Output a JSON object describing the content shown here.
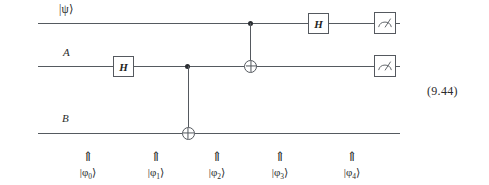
{
  "figure": {
    "type": "quantum-circuit-diagram",
    "equation_number": "(9.44)",
    "ink_color": "#55595f",
    "text_color": "#2b2b2b"
  },
  "wires": [
    {
      "id": "psi",
      "label": "|ψ⟩",
      "name": "psi-wire"
    },
    {
      "id": "a",
      "label": "A",
      "name": "a-wire"
    },
    {
      "id": "b",
      "label": "B",
      "name": "b-wire"
    }
  ],
  "gates": [
    {
      "id": "h-a",
      "label": "H",
      "kind": "hadamard",
      "wire": "a",
      "column": 1
    },
    {
      "id": "cnot-ab",
      "label": "",
      "kind": "cnot",
      "control": "a",
      "target": "b",
      "column": 2
    },
    {
      "id": "cnot-psia",
      "label": "",
      "kind": "cnot",
      "control": "psi",
      "target": "a",
      "column": 3
    },
    {
      "id": "h-psi",
      "label": "H",
      "kind": "hadamard",
      "wire": "psi",
      "column": 4
    },
    {
      "id": "meas-psi",
      "label": "",
      "kind": "measurement",
      "wire": "psi",
      "column": 5
    },
    {
      "id": "meas-a",
      "label": "",
      "kind": "measurement",
      "wire": "a",
      "column": 5
    }
  ],
  "steps": [
    {
      "arrow": "⇑",
      "state_prefix": "|φ",
      "index": "0",
      "state_suffix": "⟩"
    },
    {
      "arrow": "⇑",
      "state_prefix": "|φ",
      "index": "1",
      "state_suffix": "⟩"
    },
    {
      "arrow": "⇑",
      "state_prefix": "|φ",
      "index": "2",
      "state_suffix": "⟩"
    },
    {
      "arrow": "⇑",
      "state_prefix": "|φ",
      "index": "3",
      "state_suffix": "⟩"
    },
    {
      "arrow": "⇑",
      "state_prefix": "|φ",
      "index": "4",
      "state_suffix": "⟩"
    }
  ],
  "icons": {
    "meter": "measurement-meter-icon"
  }
}
